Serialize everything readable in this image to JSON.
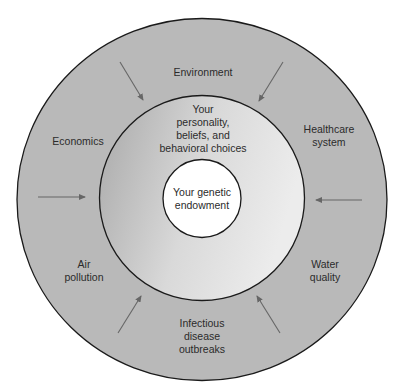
{
  "diagram": {
    "type": "concentric-circles",
    "colors": {
      "background": "#ffffff",
      "outer_ring": "#b9b9b9",
      "middle_ring_light": "#e6e6e6",
      "middle_ring_dark": "#a9a9a9",
      "inner_circle": "#ffffff",
      "stroke": "#1a1a1a",
      "arrow": "#666666",
      "text": "#2b2b2b"
    },
    "core": {
      "label": "Your genetic\nendowment"
    },
    "middle_ring": {
      "label": "Your\npersonality,\nbeliefs, and\nbehavioral choices"
    },
    "outer_ring": {
      "factors": [
        {
          "id": "environment",
          "label": "Environment"
        },
        {
          "id": "healthcare",
          "label": "Healthcare\nsystem"
        },
        {
          "id": "water",
          "label": "Water\nquality"
        },
        {
          "id": "infectious",
          "label": "Infectious\ndisease\noutbreaks"
        },
        {
          "id": "air",
          "label": "Air\npollution"
        },
        {
          "id": "economics",
          "label": "Economics"
        }
      ]
    },
    "arrows": [
      {
        "id": "top-left",
        "direction": "inward"
      },
      {
        "id": "top-right",
        "direction": "inward"
      },
      {
        "id": "right",
        "direction": "inward"
      },
      {
        "id": "bottom-right",
        "direction": "inward"
      },
      {
        "id": "bottom-left",
        "direction": "inward"
      },
      {
        "id": "left",
        "direction": "inward"
      }
    ]
  }
}
